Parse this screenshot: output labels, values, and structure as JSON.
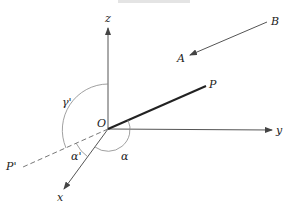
{
  "figure": {
    "caption_fragment": "",
    "axes": {
      "x": "x",
      "y": "y",
      "z": "z"
    },
    "origin_label": "O",
    "points": {
      "P": "P",
      "P_prime": "P'",
      "A": "A",
      "B": "B"
    },
    "angles": {
      "alpha": "α",
      "alpha_prime": "α'",
      "gamma_prime": "γ'"
    },
    "colors": {
      "axis": "#555555",
      "vector": "#222222",
      "dashed": "#777777",
      "arc": "#888888"
    }
  }
}
